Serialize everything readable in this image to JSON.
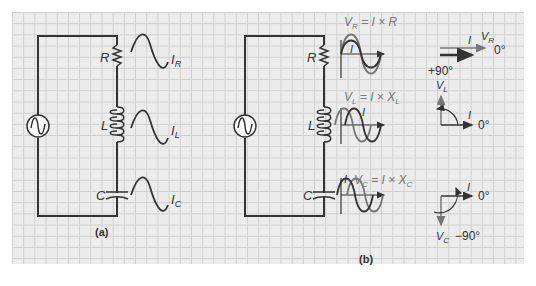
{
  "panel_a": {
    "caption": "(a)",
    "components": [
      {
        "symbol": "R",
        "wave_label": "I",
        "wave_sub": "R"
      },
      {
        "symbol": "L",
        "wave_label": "I",
        "wave_sub": "L"
      },
      {
        "symbol": "C",
        "wave_label": "I",
        "wave_sub": "C"
      }
    ]
  },
  "panel_b": {
    "caption": "(b)",
    "components": [
      {
        "symbol": "R",
        "formula_v": "V",
        "formula_sub": "R",
        "formula_rest": " = I × R",
        "wave_i": "I"
      },
      {
        "symbol": "L",
        "formula_v": "V",
        "formula_sub": "L",
        "formula_rest": " = I × X",
        "formula_rest_sub": "L",
        "wave_i": "I"
      },
      {
        "symbol": "C",
        "formula_v": "V",
        "formula_sub": "C",
        "formula_rest": " = I × X",
        "formula_rest_sub": "C",
        "wave_i": "I"
      }
    ],
    "phasors": {
      "resistor": {
        "i_label": "I",
        "v_label": "V",
        "v_sub": "R",
        "angle": "0°"
      },
      "inductor": {
        "v_angle": "+90°",
        "v_label": "V",
        "v_sub": "L",
        "i_label": "I",
        "i_angle": "0°"
      },
      "capacitor": {
        "i_label": "I",
        "i_angle": "0°",
        "v_label": "V",
        "v_sub": "C",
        "v_angle": "−90°"
      }
    }
  },
  "colors": {
    "wire": "#333333",
    "grid_bg": "#ececec",
    "grid_line": "#cfcfcf",
    "text": "#333333",
    "formula_text": "#777777",
    "voltage_arrow": "#777777"
  }
}
